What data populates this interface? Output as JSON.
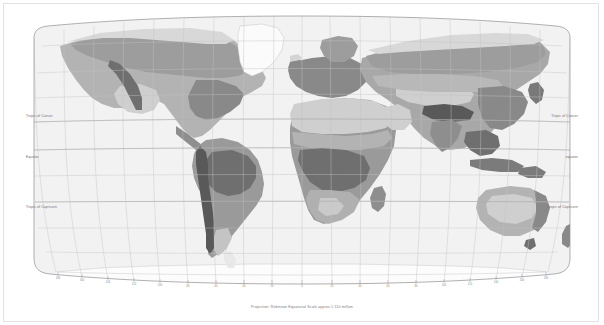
{
  "figure": {
    "caption": "Projection: Robinson        Equatorial Scale approx 1:110 million",
    "background_color": "#ffffff",
    "frame_color": "#e2e2e2"
  },
  "projection": {
    "name": "Robinson",
    "scale_text": "Equatorial Scale approx 1:110 million"
  },
  "latitude_labels": {
    "tropic_of_cancer_left": "Tropic of Cancer",
    "tropic_of_cancer_right": "Tropic of Cancer",
    "equator_left": "Equator",
    "equator_right": "equator",
    "tropic_of_capricorn_left": "Tropic of Capricorn",
    "tropic_of_capricorn_right": "Tropic of Capricorn"
  },
  "graticule": {
    "parallel_interval_deg": 15,
    "meridian_interval_deg": 20,
    "line_color": "#c9c9c9",
    "border_color": "#9a9a9a",
    "show_grid": true
  },
  "longitude_ticks": [
    "180",
    "160",
    "140",
    "120",
    "100",
    "80",
    "60",
    "40",
    "20",
    "0",
    "20",
    "40",
    "60",
    "80",
    "100",
    "120",
    "140",
    "160",
    "180"
  ],
  "ocean": {
    "fill": "#f2f2f2",
    "label": "ocean"
  },
  "legend_colors": {
    "ice_cap": "#fbfbfb",
    "tundra": "#d8d8d8",
    "boreal_forest": "#9d9d9d",
    "temperate_forest": "#8a8a8a",
    "grassland": "#b4b4b4",
    "desert": "#cfcfcf",
    "tropical_forest": "#6f6f6f",
    "mountain": "#5a5a5a"
  },
  "regions": [
    {
      "name": "Greenland ice cap",
      "zone": "ice_cap"
    },
    {
      "name": "Antarctica ice cap",
      "zone": "ice_cap"
    },
    {
      "name": "Arctic tundra",
      "zone": "tundra"
    },
    {
      "name": "Siberian boreal forest",
      "zone": "boreal_forest"
    },
    {
      "name": "Canadian boreal forest",
      "zone": "boreal_forest"
    },
    {
      "name": "Sahara desert",
      "zone": "desert"
    },
    {
      "name": "Arabian desert",
      "zone": "desert"
    },
    {
      "name": "Central Asian desert",
      "zone": "desert"
    },
    {
      "name": "Australian desert",
      "zone": "desert"
    },
    {
      "name": "Amazon tropical forest",
      "zone": "tropical_forest"
    },
    {
      "name": "Congo tropical forest",
      "zone": "tropical_forest"
    },
    {
      "name": "Southeast Asia tropical forest",
      "zone": "tropical_forest"
    },
    {
      "name": "Himalaya mountain",
      "zone": "mountain"
    },
    {
      "name": "Andes mountain",
      "zone": "mountain"
    },
    {
      "name": "North American grassland",
      "zone": "grassland"
    },
    {
      "name": "Eurasian steppe",
      "zone": "grassland"
    },
    {
      "name": "African savanna",
      "zone": "grassland"
    },
    {
      "name": "European temperate forest",
      "zone": "temperate_forest"
    },
    {
      "name": "East Asian temperate forest",
      "zone": "temperate_forest"
    },
    {
      "name": "Eastern North America temperate forest",
      "zone": "temperate_forest"
    }
  ]
}
